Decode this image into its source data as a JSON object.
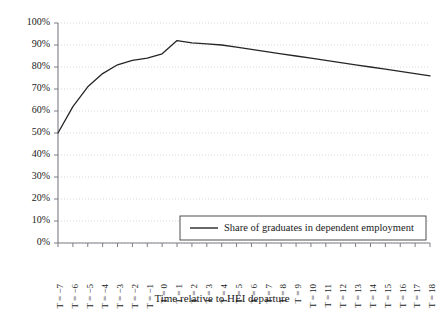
{
  "chart_data": {
    "type": "line",
    "title": "",
    "xlabel": "Time relative to HEI departure",
    "ylabel": "",
    "categories": [
      "T = −7",
      "T = −6",
      "T = −5",
      "T = −4",
      "T = −3",
      "T = −2",
      "T = −1",
      "T = 0",
      "T = 1",
      "T = 2",
      "T = 3",
      "T = 4",
      "T = 5",
      "T = 6",
      "T = 7",
      "T = 8",
      "T = 9",
      "T = 10",
      "T = 11",
      "T = 12",
      "T = 13",
      "T = 14",
      "T = 15",
      "T = 16",
      "T = 17",
      "T = 18"
    ],
    "x": [
      -7,
      -6,
      -5,
      -4,
      -3,
      -2,
      -1,
      0,
      1,
      2,
      3,
      4,
      5,
      6,
      7,
      8,
      9,
      10,
      11,
      12,
      13,
      14,
      15,
      16,
      17,
      18
    ],
    "series": [
      {
        "name": "Share of graduates in dependent employment",
        "values": [
          50,
          62,
          71,
          77,
          81,
          83,
          84,
          86,
          92,
          91,
          90.5,
          90,
          89,
          88,
          87,
          86,
          85,
          84,
          83,
          82,
          81,
          80,
          79,
          78,
          77,
          76
        ]
      }
    ],
    "ylim": [
      0,
      100
    ],
    "yticks": [
      0,
      10,
      20,
      30,
      40,
      50,
      60,
      70,
      80,
      90,
      100
    ],
    "ytick_labels": [
      "0%",
      "10%",
      "20%",
      "30%",
      "40%",
      "50%",
      "60%",
      "70%",
      "80%",
      "90%",
      "100%"
    ],
    "grid": true,
    "legend_position": "lower-right",
    "legend_entries": [
      "Share of graduates in dependent employment"
    ],
    "colors": {
      "series_line": "#262626",
      "gridline": "#c8c8d2",
      "axis": "#7d7d85",
      "background": "#ffffff",
      "text": "#1a1a1a"
    }
  }
}
